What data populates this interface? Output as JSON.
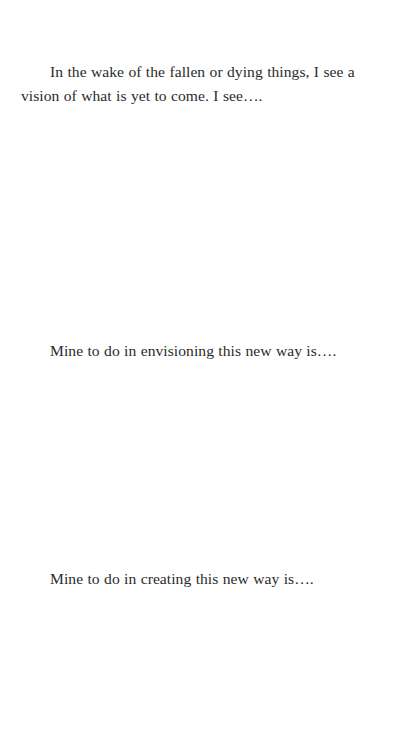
{
  "document": {
    "intro_paragraph": "In the wake of the fallen or dying things, I see a vision of what is yet to come.  I see….",
    "prompts": [
      {
        "label": "Mine to do in envisioning this new way is…."
      },
      {
        "label": "Mine to do in creating this new way is…."
      }
    ]
  }
}
